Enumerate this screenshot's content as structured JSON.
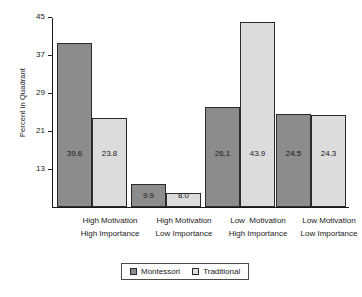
{
  "chart_data": {
    "type": "bar",
    "title": "",
    "xlabel": "",
    "ylabel": "Percent in Quadrant",
    "ylim": [
      5,
      45
    ],
    "yticks": [
      13,
      21,
      29,
      37,
      45
    ],
    "grid": false,
    "legend_position": "bottom",
    "categories": [
      "High Motivation\nHigh Importance",
      "High Motivation\nLow Importance",
      "Low  Motivation\nHigh Importance",
      "Low Motivation\nLow Importance"
    ],
    "series": [
      {
        "name": "Montessori",
        "color": "#8c8c8c",
        "values": [
          39.6,
          9.9,
          26.1,
          24.5
        ]
      },
      {
        "name": "Traditional",
        "color": "#dcdcdc",
        "values": [
          23.8,
          8.0,
          43.9,
          24.3
        ]
      }
    ],
    "value_labels": {
      "montessori": [
        "39.6",
        "9.9",
        "26.1",
        "24.5"
      ],
      "traditional": [
        "23.8",
        "8.0",
        "43.9",
        "24.3"
      ]
    }
  },
  "axis": {
    "tick_labels": [
      "45",
      "37",
      "29",
      "21",
      "13"
    ]
  },
  "legend": {
    "items": [
      {
        "label": "Montessori",
        "color": "#8c8c8c"
      },
      {
        "label": "Traditional",
        "color": "#dcdcdc"
      }
    ]
  },
  "categories_lines": [
    {
      "line1": "High Motivation",
      "line2": "High Importance"
    },
    {
      "line1": "High Motivation",
      "line2": "Low Importance"
    },
    {
      "line1": "Low  Motivation",
      "line2": "High Importance"
    },
    {
      "line1": "Low Motivation",
      "line2": "Low Importance"
    }
  ]
}
